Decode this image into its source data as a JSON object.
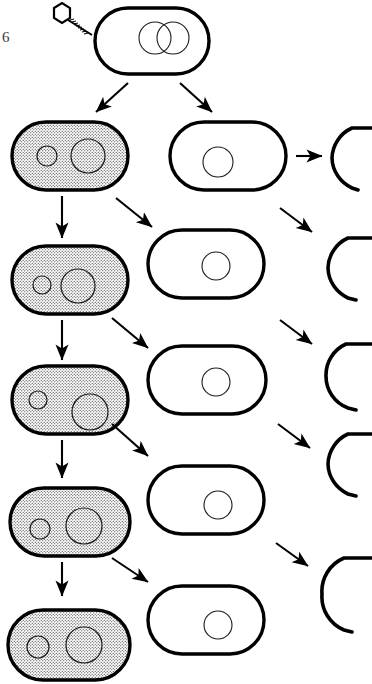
{
  "page": {
    "number": "6",
    "background_color": "#ffffff",
    "ink_color": "#000000",
    "width": 372,
    "height": 684
  },
  "figure": {
    "title": "",
    "stipple_fill_color": "#d9d9d9",
    "stipple_dot_color": "#2b2b2b"
  },
  "phage": {
    "head_label": "phage-head",
    "tail_label": "phage-tail",
    "dna_label": "injected-phage-dna"
  },
  "infected_cell": {
    "label": "infected-bacterium",
    "chromosome_label": "replicating-chromosome",
    "circle_count": "2"
  },
  "columns": {
    "left": {
      "name": "lysogenic-lineage",
      "cell_label": "shaded-bacterium",
      "shaded": "true",
      "small_circle_label": "prophage-body",
      "large_circle_label": "nucleoid"
    },
    "middle": {
      "name": "segregant-lineage",
      "cell_label": "unshaded-bacterium",
      "shaded": "false",
      "circle_label": "nucleoid"
    },
    "right": {
      "name": "lysis-outcome",
      "cell_label": "lysed-cell-ghost"
    }
  },
  "rows": [
    {
      "index": "1",
      "left_cell": "shaded-bacterium-1",
      "middle_cell": "unshaded-bacterium-1",
      "right_cell": "lysed-cell-1"
    },
    {
      "index": "2",
      "left_cell": "shaded-bacterium-2",
      "middle_cell": "unshaded-bacterium-2",
      "right_cell": "lysed-cell-2"
    },
    {
      "index": "3",
      "left_cell": "shaded-bacterium-3",
      "middle_cell": "unshaded-bacterium-3",
      "right_cell": "lysed-cell-3"
    },
    {
      "index": "4",
      "left_cell": "shaded-bacterium-4",
      "middle_cell": "unshaded-bacterium-4",
      "right_cell": "lysed-cell-4"
    },
    {
      "index": "5",
      "left_cell": "shaded-bacterium-5",
      "middle_cell": "unshaded-bacterium-5",
      "right_cell": "lysed-cell-5"
    }
  ],
  "arrows": {
    "split_left_label": "division-arrow-to-shaded",
    "split_right_label": "division-arrow-to-unshaded",
    "vertical_label": "division-arrow-vertical",
    "diagonal_label": "division-arrow-diagonal",
    "lysis_label": "lysis-arrow"
  }
}
